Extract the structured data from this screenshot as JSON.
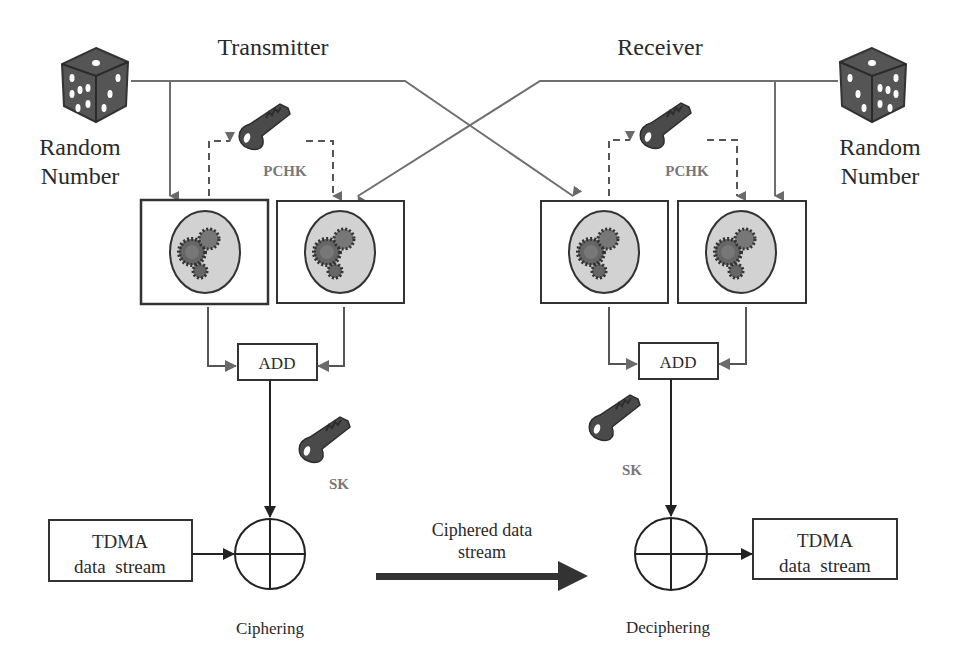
{
  "diagram": {
    "type": "block-diagram",
    "sections": {
      "transmitter": {
        "title": "Transmitter"
      },
      "receiver": {
        "title": "Receiver"
      }
    },
    "random_number_left": {
      "line1": "Random",
      "line2": "Number",
      "icon": "dice-icon"
    },
    "random_number_right": {
      "line1": "Random",
      "line2": "Number",
      "icon": "dice-icon"
    },
    "key_pchk_left": {
      "label": "PCHK",
      "icon": "key-icon"
    },
    "key_pchk_right": {
      "label": "PCHK",
      "icon": "key-icon"
    },
    "key_sk_left": {
      "label": "SK",
      "icon": "key-icon"
    },
    "key_sk_right": {
      "label": "SK",
      "icon": "key-icon"
    },
    "add_left": {
      "label": "ADD"
    },
    "add_right": {
      "label": "ADD"
    },
    "tdma_left": {
      "line1": "TDMA",
      "line2": "data  stream"
    },
    "tdma_right": {
      "line1": "TDMA",
      "line2": "data  stream"
    },
    "xor_left": {
      "caption": "Ciphering"
    },
    "xor_right": {
      "caption": "Deciphering"
    },
    "channel": {
      "line1": "Ciphered data",
      "line2": "stream"
    },
    "processor_blocks": [
      "gear-process-1",
      "gear-process-2",
      "gear-process-3",
      "gear-process-4"
    ],
    "colors": {
      "line": "#6f6f6f",
      "dark": "#222222",
      "gear_bg": "#d2d2d2",
      "gear": "#4a4a4a"
    }
  }
}
